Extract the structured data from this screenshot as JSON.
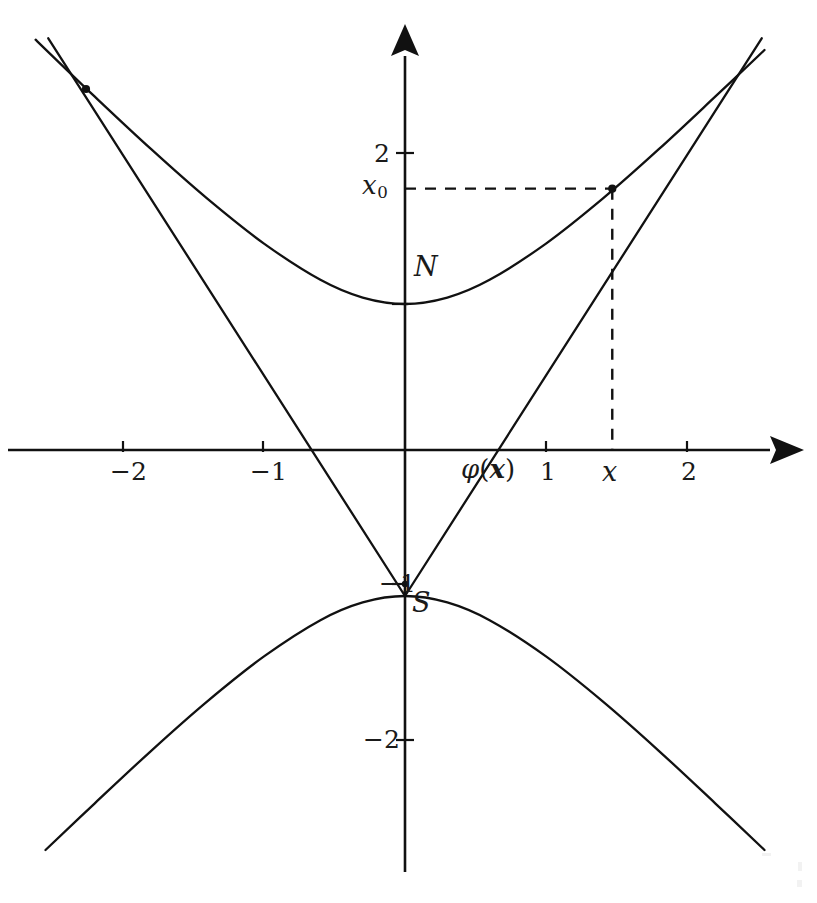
{
  "figure": {
    "kind": "math-diagram"
  },
  "chart_data": {
    "type": "line",
    "title": "",
    "subtitle": "",
    "xlabel": "",
    "ylabel": "",
    "grid": false,
    "legend_position": "none",
    "xlim": [
      -2.65,
      2.65
    ],
    "ylim": [
      -2.8,
      2.85
    ],
    "x_ticks": [
      -2,
      -1,
      1,
      2
    ],
    "x_tick_labels": [
      "-2",
      "-1",
      "1",
      "2"
    ],
    "y_ticks": [
      -2,
      -1,
      1,
      2
    ],
    "y_tick_labels": [
      "-2",
      "-1",
      "1",
      "2"
    ],
    "extra_x_ticks": [
      {
        "value": 1.47,
        "label": "x",
        "italic": true,
        "dashed_guide": true
      }
    ],
    "extra_y_ticks": [
      {
        "value": 1.79,
        "label": "x_0",
        "display": "x₀",
        "dashed_guide": true
      }
    ],
    "series": [
      {
        "name": "upper-branch",
        "kind": "curve",
        "equation": "y = sqrt(1 + x^2)",
        "x": [
          -2.62,
          -2.2,
          -1.8,
          -1.4,
          -1.0,
          -0.6,
          -0.3,
          0,
          0.3,
          0.6,
          1.0,
          1.4,
          1.8,
          2.2,
          2.55
        ],
        "y": [
          2.81,
          2.42,
          2.06,
          1.72,
          1.414,
          1.166,
          1.044,
          1.0,
          1.044,
          1.166,
          1.414,
          1.72,
          2.06,
          2.42,
          2.74
        ]
      },
      {
        "name": "lower-branch",
        "kind": "curve",
        "equation": "y = -sqrt(1 + x^2)",
        "x": [
          -2.55,
          -2.2,
          -1.8,
          -1.4,
          -1.0,
          -0.6,
          -0.3,
          0,
          0.3,
          0.6,
          1.0,
          1.4,
          1.8,
          2.2,
          2.55
        ],
        "y": [
          -2.74,
          -2.42,
          -2.06,
          -1.72,
          -1.414,
          -1.166,
          -1.044,
          -1.0,
          -1.044,
          -1.166,
          -1.414,
          -1.72,
          -2.06,
          -2.42,
          -2.74
        ]
      },
      {
        "name": "ray-right",
        "kind": "segment",
        "from": [
          0,
          -1
        ],
        "to": [
          2.53,
          2.82
        ],
        "note": "ray from S through the marked point on the upper branch"
      },
      {
        "name": "ray-left",
        "kind": "segment",
        "from": [
          0,
          -1
        ],
        "to": [
          -2.53,
          2.82
        ],
        "note": "mirrored ray from S through the left intersection point"
      }
    ],
    "points": [
      {
        "name": "N",
        "x": 0,
        "y": 1,
        "label": "N",
        "label_dx": 0.1,
        "label_dy": 0.26
      },
      {
        "name": "S",
        "x": 0,
        "y": -1,
        "label": "S",
        "label_dx": 0.1,
        "label_dy": -0.28
      },
      {
        "name": "P",
        "x": 1.47,
        "y": 1.79,
        "label": "",
        "marked": true
      },
      {
        "name": "P-mirror",
        "x": -2.28,
        "y": 2.5,
        "label": "",
        "marked": true
      }
    ],
    "annotations": [
      {
        "text": "φ(x)",
        "x": 0.62,
        "y": -0.17,
        "style": "phi-of-bold-x"
      },
      {
        "text": "N",
        "x": 0.11,
        "y": 1.26
      },
      {
        "text": "S",
        "x": 0.11,
        "y": -1.28
      },
      {
        "text": "x₀",
        "x": -0.2,
        "y": 1.79
      },
      {
        "text": "x",
        "x": 1.47,
        "y": -0.17
      }
    ]
  },
  "labels": {
    "x_neg2": "−2",
    "x_neg1": "−1",
    "x_pos1": "1",
    "x_pos2": "2",
    "y_pos1": "1",
    "y_pos2": "2",
    "y_neg1": "−1",
    "y_neg2": "−2",
    "north_pole": "N",
    "south_pole": "S",
    "x_marker": "x",
    "x0_marker_base": "x",
    "x0_marker_sub": "0",
    "phi_symbol": "φ",
    "phi_open": "(",
    "phi_arg": "x",
    "phi_close": ")"
  },
  "colors": {
    "ink": "#111111",
    "background": "#ffffff"
  }
}
